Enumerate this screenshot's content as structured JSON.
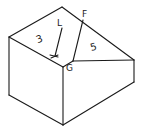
{
  "diagram": {
    "type": "isometric-block-sketch",
    "stroke_color": "#1a1a1a",
    "background": "#ffffff",
    "labels": {
      "face_top_left": "3",
      "face_top_right": "5",
      "point_l": "L",
      "point_k": "K",
      "point_f": "F",
      "point_g": "G"
    }
  }
}
